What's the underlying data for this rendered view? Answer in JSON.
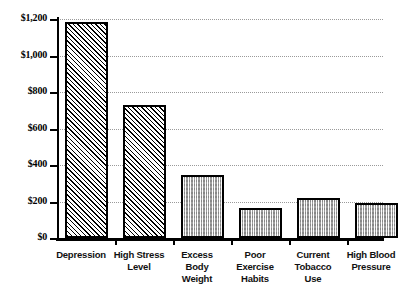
{
  "chart_data": {
    "type": "bar",
    "title": "",
    "xlabel": "",
    "ylabel": "",
    "categories": [
      "Depression",
      "High Stress Level",
      "Excess Body Weight",
      "Poor Exercise Habits",
      "Current Tobacco Use",
      "High Blood Pressure"
    ],
    "values": [
      1185,
      730,
      345,
      165,
      220,
      190
    ],
    "ylim": [
      0,
      1200
    ],
    "ytick_values": [
      0,
      200,
      400,
      600,
      800,
      1000,
      1200
    ],
    "ytick_labels": [
      "$0",
      "$200",
      "$400",
      "$600",
      "$800",
      "$1,000",
      "$1,200"
    ],
    "grid": true,
    "legend": "none",
    "series": [
      {
        "name": "Annual cost per employee",
        "values": [
          1185,
          730,
          345,
          165,
          220,
          190
        ]
      }
    ],
    "bar_fills": [
      "hatch",
      "hatch",
      "dots",
      "dots",
      "dots",
      "dots"
    ],
    "category_lines": [
      [
        "Depression"
      ],
      [
        "High Stress",
        "Level"
      ],
      [
        "Excess",
        "Body",
        "Weight"
      ],
      [
        "Poor",
        "Exercise",
        "Habits"
      ],
      [
        "Current",
        "Tobacco",
        "Use"
      ],
      [
        "High Blood",
        "Pressure"
      ]
    ],
    "colors": {
      "bar_outline": "#000000",
      "bar_hatch": "#000000",
      "bar_fill_grey": "#c9c9c9",
      "gridline": "#9a9a9a",
      "axis": "#000000",
      "text": "#000000",
      "background": "#ffffff"
    }
  }
}
